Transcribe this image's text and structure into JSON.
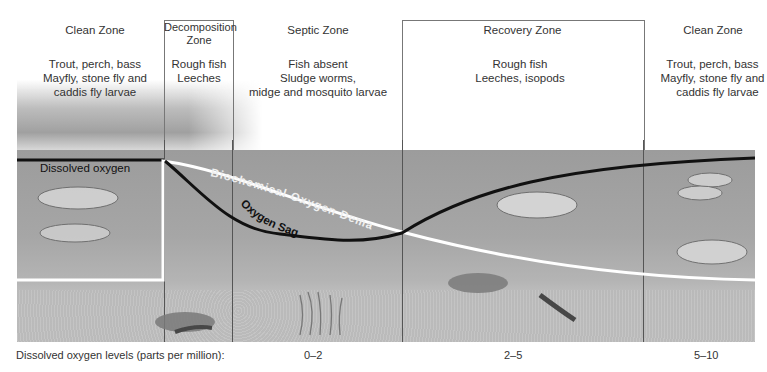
{
  "zones": [
    {
      "id": "clean-left",
      "title": "Clean Zone",
      "organisms": [
        "Trout, perch, bass",
        "Mayfly, stone fly and",
        "caddis fly larvae"
      ]
    },
    {
      "id": "decomposition",
      "title_lines": [
        "Decomposition",
        "Zone"
      ],
      "organisms": [
        "Rough fish",
        "Leeches"
      ]
    },
    {
      "id": "septic",
      "title": "Septic Zone",
      "organisms": [
        "Fish absent",
        "Sludge worms,",
        "midge and mosquito larvae"
      ]
    },
    {
      "id": "recovery",
      "title": "Recovery Zone",
      "organisms": [
        "Rough fish",
        "Leeches, isopods"
      ]
    },
    {
      "id": "clean-right",
      "title": "Clean Zone",
      "organisms": [
        "Trout, perch, bass",
        "Mayfly, stone fly and",
        "caddis fly larvae"
      ]
    }
  ],
  "curves": {
    "dissolved_oxygen_label": "Dissolved oxygen",
    "bod_label": "Biochemical Oxygen Demand",
    "oxygen_sag_label": "Oxygen Sag"
  },
  "bottom": {
    "label": "Dissolved oxygen levels (parts per million):",
    "levels": [
      "0–2",
      "2–5",
      "5–10"
    ]
  },
  "colors": {
    "water": "#a6a6a6",
    "do_curve": "#111111",
    "bod_curve": "#ffffff",
    "divider": "#555555"
  }
}
